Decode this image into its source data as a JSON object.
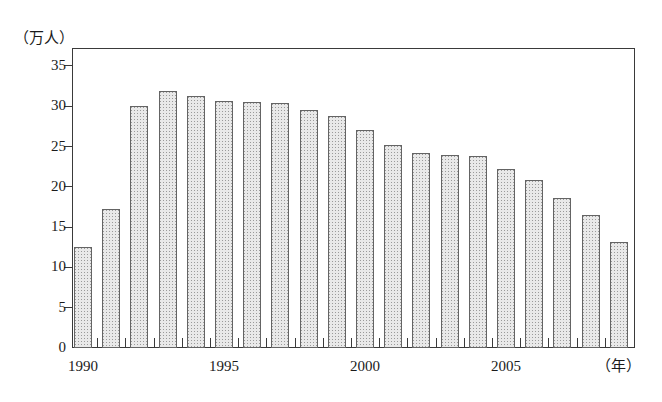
{
  "chart_data": {
    "type": "bar",
    "title": "",
    "subtitle": "",
    "unit_label": "（万人）",
    "xlabel": "（年）",
    "ylabel": "",
    "ylim": [
      0,
      35
    ],
    "y_major_step": 5,
    "y_minor_step": 2.5,
    "grid": false,
    "legend": null,
    "y_ticks": [
      "0",
      "5",
      "10",
      "15",
      "20",
      "25",
      "30",
      "35"
    ],
    "x_tick_labels": [
      "1990",
      "1995",
      "2000",
      "2005"
    ],
    "x_tick_label_years": [
      1990,
      1995,
      2000,
      2005
    ],
    "categories": [
      "1990",
      "1991",
      "1992",
      "1993",
      "1994",
      "1995",
      "1996",
      "1997",
      "1998",
      "1999",
      "2000",
      "2001",
      "2002",
      "2003",
      "2004",
      "2005",
      "2006",
      "2007",
      "2008",
      "2009"
    ],
    "values": [
      12.5,
      17.3,
      30.0,
      31.9,
      31.3,
      30.7,
      30.5,
      30.4,
      29.6,
      28.8,
      27.1,
      25.2,
      24.2,
      24.0,
      23.8,
      22.2,
      20.8,
      18.6,
      16.5,
      13.2
    ],
    "bar_fill_color": "#e9e9e9",
    "bar_edge_color": "#646464",
    "axis_color": "#3a3a3a",
    "background_color": "#ffffff"
  }
}
